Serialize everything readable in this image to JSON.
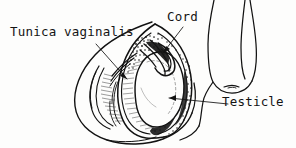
{
  "figure": {
    "kind": "anatomical-line-drawing",
    "background_color": "#fdfdfc",
    "ink_color": "#121212",
    "width": 296,
    "height": 148
  },
  "labels": {
    "tunica_vaginalis": "Tunica vaginalis",
    "cord": "Cord",
    "testicle": "Testicle"
  },
  "leaders": [
    {
      "name": "tunica-vaginalis-leader",
      "from_label": "Tunica vaginalis",
      "arrow": true,
      "points": "96,44 127,79"
    },
    {
      "name": "cord-leader",
      "from_label": "Cord",
      "arrow": true,
      "points": "183,27 163,53"
    },
    {
      "name": "testicle-leader",
      "from_label": "Testicle",
      "arrow": true,
      "points": "228,104 169,98"
    }
  ],
  "structures": [
    {
      "name": "scrotum-outline",
      "description": "outer scrotal sac contour, large rounded mass on the left"
    },
    {
      "name": "penis-outline",
      "description": "penile shaft contour descending at upper right"
    },
    {
      "name": "tunica-vaginalis-sac",
      "description": "opened serous sac with hatched inner surface surrounding the testicle"
    },
    {
      "name": "testicle-body",
      "description": "large pale ovoid organ at center"
    },
    {
      "name": "spermatic-cord",
      "description": "tubular cord structures entering from above through stippled fatty tissue"
    },
    {
      "name": "stipple-shading",
      "description": "dark stippled tissue near the cord and along the sac cut edge"
    },
    {
      "name": "hatching",
      "description": "fine parallel hatch strokes on the inner sac wall"
    }
  ]
}
